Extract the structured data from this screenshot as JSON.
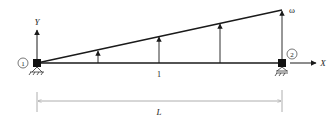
{
  "diagram": {
    "nodes": [
      {
        "id": "1",
        "label": "1"
      },
      {
        "id": "2",
        "label": "2"
      }
    ],
    "element_label": "1",
    "axes": {
      "x_label": "X",
      "y_label": "Y"
    },
    "load_label": "ω",
    "dimension_label": "L",
    "colors": {
      "line": "#1a1a1a",
      "dimension": "#9a9a9a",
      "node": "#111111"
    }
  }
}
